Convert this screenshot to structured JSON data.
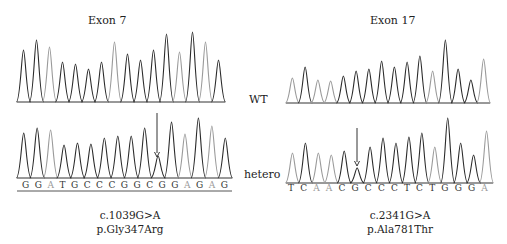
{
  "panels": [
    {
      "title": "Exon 7",
      "wt_peaks": [
        0.52,
        0.62,
        0.55,
        0.4,
        0.38,
        0.33,
        0.4,
        0.6,
        0.48,
        0.42,
        0.52,
        0.68,
        0.5,
        0.7,
        0.6,
        0.42
      ],
      "wt_shades": [
        "d",
        "d",
        "l",
        "d",
        "d",
        "d",
        "d",
        "l",
        "d",
        "d",
        "d",
        "d",
        "l",
        "d",
        "l",
        "d"
      ],
      "het_peaks": [
        0.45,
        0.5,
        0.48,
        0.33,
        0.35,
        0.34,
        0.4,
        0.42,
        0.42,
        0.5,
        0.22,
        0.56,
        0.44,
        0.6,
        0.52,
        0.4
      ],
      "het_shades": [
        "d",
        "d",
        "l",
        "d",
        "d",
        "d",
        "d",
        "d",
        "d",
        "d",
        "d",
        "d",
        "l",
        "d",
        "l",
        "d"
      ],
      "sequence": [
        "G",
        "G",
        "A",
        "T",
        "G",
        "C",
        "C",
        "C",
        "G",
        "G",
        "C",
        "G",
        "G",
        "A",
        "G",
        "A",
        "G"
      ],
      "mutation_index": 10,
      "cdna": "c.1039G>A",
      "protein": "p.Gly347Arg"
    },
    {
      "title": "Exon 17",
      "wt_peaks": [
        0.25,
        0.36,
        0.23,
        0.22,
        0.27,
        0.32,
        0.34,
        0.42,
        0.36,
        0.41,
        0.47,
        0.32,
        0.63,
        0.34,
        0.23,
        0.44
      ],
      "wt_shades": [
        "l",
        "d",
        "l",
        "l",
        "d",
        "d",
        "d",
        "d",
        "d",
        "d",
        "d",
        "l",
        "d",
        "d",
        "d",
        "l"
      ],
      "het_peaks": [
        0.3,
        0.4,
        0.3,
        0.28,
        0.32,
        0.15,
        0.36,
        0.45,
        0.4,
        0.46,
        0.5,
        0.36,
        0.65,
        0.4,
        0.28,
        0.52
      ],
      "het_shades": [
        "l",
        "d",
        "l",
        "l",
        "d",
        "d",
        "d",
        "d",
        "d",
        "d",
        "d",
        "l",
        "d",
        "d",
        "d",
        "l"
      ],
      "sequence": [
        "T",
        "C",
        "A",
        "A",
        "C",
        "G",
        "C",
        "C",
        "C",
        "T",
        "C",
        "T",
        "G",
        "G",
        "G",
        "A"
      ],
      "mutation_index": 5,
      "cdna": "c.2341G>A",
      "protein": "p.Ala781Thr"
    }
  ],
  "row_labels": {
    "wt": "WT",
    "het": "hetero"
  },
  "colors": {
    "dark_trace": "#2a2a2a",
    "light_trace": "#9a9a9a",
    "baseline": "#333333"
  }
}
